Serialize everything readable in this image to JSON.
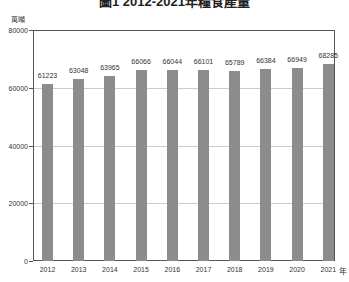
{
  "chart_data": {
    "type": "bar",
    "title": "圖1 2012-2021年糧食產量",
    "xlabel": "年",
    "ylabel": "萬噸",
    "categories": [
      "2012",
      "2013",
      "2014",
      "2015",
      "2016",
      "2017",
      "2018",
      "2019",
      "2020",
      "2021"
    ],
    "values": [
      61223,
      63048,
      63965,
      66066,
      66044,
      66101,
      65789,
      66384,
      66949,
      68285
    ],
    "data_labels": [
      "61223",
      "63048",
      "63965",
      "66066",
      "66044",
      "66101",
      "65789",
      "66384",
      "66949",
      "68285"
    ],
    "ylim": [
      0,
      80000
    ],
    "yticks": [
      0,
      20000,
      40000,
      60000,
      80000
    ],
    "ytick_labels": [
      "0",
      "20000",
      "40000",
      "60000",
      "80000"
    ],
    "grid": true,
    "legend": null,
    "bar_color": "#8c8c8c"
  },
  "labels": {
    "title": "圖1 2012-2021年糧食產量",
    "y_unit": "萬噸",
    "x_unit": "年"
  }
}
